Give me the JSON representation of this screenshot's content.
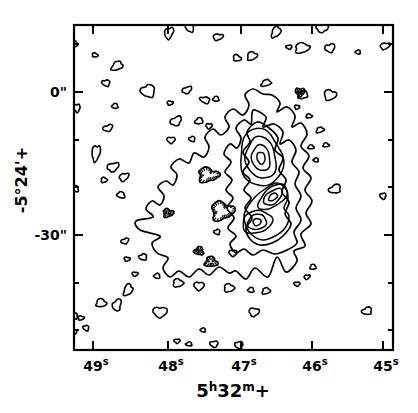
{
  "figure": {
    "background": "#ffffff",
    "line_color": "#000000",
    "kind": "radio continuum contour map"
  },
  "chart_data": {
    "type": "contour",
    "title": "",
    "xlabel": {
      "plain": "5h32m+",
      "parts": [
        {
          "text": "5"
        },
        {
          "text": "h",
          "sup": true
        },
        {
          "text": "32"
        },
        {
          "text": "m",
          "sup": true
        },
        {
          "text": "+"
        }
      ]
    },
    "ylabel": {
      "plain": "-5°24'+"
    },
    "x_ticks": [
      {
        "value": 49,
        "parts": [
          {
            "text": "49"
          },
          {
            "text": "s",
            "sup": true
          }
        ]
      },
      {
        "value": 48,
        "parts": [
          {
            "text": "48"
          },
          {
            "text": "s",
            "sup": true
          }
        ]
      },
      {
        "value": 47,
        "parts": [
          {
            "text": "47"
          },
          {
            "text": "s",
            "sup": true
          }
        ]
      },
      {
        "value": 46,
        "parts": [
          {
            "text": "46"
          },
          {
            "text": "s",
            "sup": true
          }
        ]
      },
      {
        "value": 45,
        "parts": [
          {
            "text": "45"
          },
          {
            "text": "s",
            "sup": true
          }
        ]
      }
    ],
    "y_ticks": [
      {
        "value": 0,
        "label": "0\""
      },
      {
        "value": -30,
        "label": "-30\""
      }
    ],
    "x_range_seconds": [
      49.3,
      44.8
    ],
    "y_range_arcsec": [
      14,
      -54
    ],
    "y_minor_tick_step_arcsec": 10,
    "levels_labeled": false,
    "visible_nested_levels": 6,
    "peaks": [
      {
        "ra_s": 46.67,
        "dec_arcsec": -13.8
      },
      {
        "ra_s": 46.52,
        "dec_arcsec": -22.0
      },
      {
        "ra_s": 46.74,
        "dec_arcsec": -27.3
      }
    ],
    "negative_features_ticked_contours": [
      {
        "ra_s": 46.14,
        "dec_arcsec": 0.0
      },
      {
        "ra_s": 47.41,
        "dec_arcsec": -17.4
      },
      {
        "ra_s": 47.22,
        "dec_arcsec": -24.9
      },
      {
        "ra_s": 47.54,
        "dec_arcsec": -33.3
      },
      {
        "ra_s": 47.37,
        "dec_arcsec": -35.6
      },
      {
        "ra_s": 47.97,
        "dec_arcsec": -25.4
      }
    ]
  },
  "render": {
    "size": {
      "w": 418,
      "h": 413
    },
    "plot": {
      "left": 74,
      "top": 25,
      "right": 393,
      "bottom": 350
    },
    "stroke": {
      "frame": 2.2,
      "tick": 2,
      "contour": 1.7,
      "blob": 1.6,
      "ring": 1.5
    },
    "ticks": {
      "x_major_px": [
        93,
        168,
        241,
        312,
        383
      ],
      "y_major_px": [
        92,
        235
      ],
      "y_minor_px": [
        44,
        140,
        187,
        283,
        330
      ],
      "major_len": 9,
      "minor_len": 5
    },
    "labels": {
      "x_tick_baseline": 371,
      "x_tick_size": 14,
      "sup_size": 10,
      "y_tick_x": 67,
      "y_tick_baselines": [
        97,
        240
      ],
      "y_tick_size": 14,
      "x_title": {
        "x": 233,
        "y": 397,
        "size": 18,
        "sup_size": 12
      },
      "y_title": {
        "x": 27,
        "y": 180,
        "size": 16
      }
    },
    "contours": {
      "outer": [
        [
          272,
          95
        ],
        [
          280,
          103
        ],
        [
          277,
          112
        ],
        [
          287,
          107
        ],
        [
          295,
          116
        ],
        [
          292,
          127
        ],
        [
          301,
          123
        ],
        [
          307,
          134
        ],
        [
          301,
          146
        ],
        [
          309,
          156
        ],
        [
          303,
          168
        ],
        [
          311,
          178
        ],
        [
          305,
          190
        ],
        [
          312,
          201
        ],
        [
          306,
          213
        ],
        [
          311,
          224
        ],
        [
          301,
          234
        ],
        [
          305,
          246
        ],
        [
          294,
          251
        ],
        [
          297,
          261
        ],
        [
          286,
          272
        ],
        [
          277,
          257
        ],
        [
          268,
          277
        ],
        [
          255,
          268
        ],
        [
          246,
          279
        ],
        [
          236,
          271
        ],
        [
          229,
          273
        ],
        [
          219,
          267
        ],
        [
          209,
          275
        ],
        [
          199,
          269
        ],
        [
          189,
          277
        ],
        [
          179,
          271
        ],
        [
          170,
          277
        ],
        [
          163,
          268
        ],
        [
          168,
          258
        ],
        [
          157,
          253
        ],
        [
          152,
          243
        ],
        [
          160,
          236
        ],
        [
          140,
          230
        ],
        [
          136,
          221
        ],
        [
          153,
          217
        ],
        [
          146,
          209
        ],
        [
          152,
          201
        ],
        [
          160,
          205
        ],
        [
          164,
          196
        ],
        [
          158,
          187
        ],
        [
          166,
          181
        ],
        [
          173,
          185
        ],
        [
          177,
          175
        ],
        [
          171,
          167
        ],
        [
          179,
          159
        ],
        [
          189,
          163
        ],
        [
          194,
          153
        ],
        [
          204,
          157
        ],
        [
          209,
          147
        ],
        [
          205,
          137
        ],
        [
          213,
          129
        ],
        [
          221,
          135
        ],
        [
          229,
          127
        ],
        [
          225,
          117
        ],
        [
          233,
          109
        ],
        [
          243,
          115
        ],
        [
          249,
          105
        ],
        [
          245,
          95
        ],
        [
          253,
          89
        ],
        [
          263,
          94
        ]
      ],
      "ridge": [
        [
          255,
          110
        ],
        [
          266,
          117
        ],
        [
          263,
          127
        ],
        [
          274,
          124
        ],
        [
          283,
          132
        ],
        [
          280,
          144
        ],
        [
          289,
          140
        ],
        [
          296,
          150
        ],
        [
          292,
          162
        ],
        [
          299,
          172
        ],
        [
          295,
          184
        ],
        [
          301,
          196
        ],
        [
          296,
          208
        ],
        [
          301,
          220
        ],
        [
          294,
          232
        ],
        [
          297,
          243
        ],
        [
          287,
          250
        ],
        [
          275,
          254
        ],
        [
          263,
          250
        ],
        [
          253,
          255
        ],
        [
          244,
          249
        ],
        [
          236,
          253
        ],
        [
          230,
          244
        ],
        [
          236,
          236
        ],
        [
          228,
          228
        ],
        [
          234,
          218
        ],
        [
          227,
          208
        ],
        [
          233,
          198
        ],
        [
          226,
          190
        ],
        [
          232,
          180
        ],
        [
          225,
          172
        ],
        [
          231,
          162
        ],
        [
          224,
          154
        ],
        [
          230,
          144
        ],
        [
          237,
          148
        ],
        [
          241,
          138
        ],
        [
          236,
          128
        ],
        [
          244,
          120
        ],
        [
          251,
          124
        ],
        [
          252,
          113
        ]
      ],
      "ridge_inner": [
        [
          257,
          122
        ],
        [
          269,
          128
        ],
        [
          278,
          138
        ],
        [
          275,
          150
        ],
        [
          283,
          158
        ],
        [
          279,
          170
        ],
        [
          286,
          180
        ],
        [
          282,
          192
        ],
        [
          289,
          202
        ],
        [
          285,
          214
        ],
        [
          291,
          224
        ],
        [
          283,
          236
        ],
        [
          272,
          243
        ],
        [
          260,
          245
        ],
        [
          250,
          239
        ],
        [
          246,
          228
        ],
        [
          252,
          218
        ],
        [
          245,
          208
        ],
        [
          251,
          198
        ],
        [
          244,
          190
        ],
        [
          250,
          180
        ],
        [
          243,
          172
        ],
        [
          249,
          162
        ],
        [
          243,
          152
        ],
        [
          250,
          142
        ],
        [
          247,
          132
        ]
      ],
      "lower_pair_ring": [
        [
          248,
          206
        ],
        [
          256,
          196
        ],
        [
          265,
          189
        ],
        [
          276,
          183
        ],
        [
          285,
          188
        ],
        [
          288,
          198
        ],
        [
          284,
          208
        ],
        [
          289,
          216
        ],
        [
          285,
          228
        ],
        [
          275,
          236
        ],
        [
          263,
          240
        ],
        [
          252,
          235
        ],
        [
          246,
          226
        ],
        [
          244,
          216
        ]
      ],
      "peak_rings": [
        {
          "cx": 261,
          "cy": 158,
          "rot": -10,
          "rings": [
            [
              21,
              29
            ],
            [
              15,
              21
            ],
            [
              9,
              13
            ],
            [
              4,
              6
            ]
          ]
        },
        {
          "cx": 273,
          "cy": 197,
          "rot": -38,
          "rings": [
            [
              17,
              9
            ],
            [
              11,
              6
            ],
            [
              5,
              3
            ]
          ]
        },
        {
          "cx": 257,
          "cy": 222,
          "rot": -15,
          "rings": [
            [
              15,
              11
            ],
            [
              9.5,
              7.5
            ],
            [
              4,
              3.5
            ]
          ]
        }
      ]
    },
    "hatched": [
      {
        "cx": 300,
        "cy": 92,
        "rx": 4.5,
        "ry": 4
      },
      {
        "cx": 208,
        "cy": 175,
        "rx": 10,
        "ry": 7
      },
      {
        "cx": 222,
        "cy": 211,
        "rx": 11,
        "ry": 9
      },
      {
        "cx": 199,
        "cy": 251,
        "rx": 4.5,
        "ry": 4
      },
      {
        "cx": 211,
        "cy": 262,
        "rx": 6,
        "ry": 5
      },
      {
        "cx": 168,
        "cy": 213,
        "rx": 5,
        "ry": 4
      }
    ],
    "blobs": [
      [
        95,
        55,
        3,
        2,
        20
      ],
      [
        117,
        66,
        6,
        4,
        -30
      ],
      [
        106,
        83,
        4,
        3,
        10
      ],
      [
        115,
        106,
        3,
        2.5,
        0
      ],
      [
        108,
        128,
        5,
        3,
        -20
      ],
      [
        96,
        153,
        4,
        8,
        10
      ],
      [
        113,
        167,
        6,
        4,
        -20
      ],
      [
        104,
        180,
        3,
        2.5,
        0
      ],
      [
        124,
        177,
        5,
        3.5,
        -30
      ],
      [
        121,
        195,
        4,
        3,
        20
      ],
      [
        148,
        91,
        7,
        6,
        0
      ],
      [
        170,
        103,
        3,
        2,
        0
      ],
      [
        187,
        90,
        5,
        3,
        -25
      ],
      [
        205,
        100,
        5,
        3,
        15
      ],
      [
        216,
        99,
        3,
        2.5,
        0
      ],
      [
        176,
        121,
        6,
        4,
        -30
      ],
      [
        171,
        140,
        4,
        3,
        0
      ],
      [
        192,
        139,
        3,
        2.5,
        0
      ],
      [
        169,
        33,
        4,
        6,
        25
      ],
      [
        190,
        27,
        4,
        5,
        0
      ],
      [
        218,
        37,
        5,
        3,
        -10
      ],
      [
        237,
        58,
        4,
        3,
        20
      ],
      [
        252,
        56,
        5,
        4,
        -20
      ],
      [
        266,
        83,
        5,
        3,
        -20
      ],
      [
        276,
        32,
        4,
        6,
        30
      ],
      [
        289,
        47,
        3,
        2,
        0
      ],
      [
        302,
        48,
        7,
        5,
        -10
      ],
      [
        322,
        28,
        6,
        4,
        0
      ],
      [
        330,
        48,
        5,
        4,
        -20
      ],
      [
        358,
        52,
        2.5,
        2,
        0
      ],
      [
        385,
        46,
        5,
        3,
        -15
      ],
      [
        330,
        95,
        6,
        5,
        0
      ],
      [
        303,
        95,
        5,
        3.5,
        -30
      ],
      [
        297,
        107,
        2.5,
        2,
        0
      ],
      [
        309,
        116,
        3,
        2,
        0
      ],
      [
        320,
        130,
        4,
        2.5,
        -20
      ],
      [
        326,
        145,
        3,
        2,
        0
      ],
      [
        335,
        189,
        6,
        4,
        -20
      ],
      [
        383,
        196,
        3,
        3,
        0
      ],
      [
        311,
        147,
        3,
        2,
        0
      ],
      [
        316,
        160,
        2.5,
        2,
        0
      ],
      [
        199,
        121,
        4,
        3,
        -20
      ],
      [
        209,
        126,
        3,
        2.5,
        0
      ],
      [
        217,
        232,
        3,
        2.5,
        0
      ],
      [
        233,
        253,
        4,
        3,
        0
      ],
      [
        125,
        241,
        4,
        2.5,
        -20
      ],
      [
        143,
        257,
        4,
        3,
        0
      ],
      [
        127,
        259,
        3,
        2,
        0
      ],
      [
        157,
        276,
        3,
        2.5,
        0
      ],
      [
        178,
        283,
        5,
        4,
        0
      ],
      [
        199,
        286,
        5,
        4,
        0
      ],
      [
        135,
        274,
        3,
        2,
        0
      ],
      [
        128,
        290,
        4,
        6,
        25
      ],
      [
        101,
        303,
        5,
        4,
        0
      ],
      [
        117,
        305,
        4,
        6,
        20
      ],
      [
        81,
        318,
        3,
        2,
        0
      ],
      [
        86,
        328,
        3,
        2.5,
        30
      ],
      [
        160,
        312,
        7,
        5,
        0
      ],
      [
        177,
        341,
        3,
        2,
        0
      ],
      [
        189,
        344,
        3,
        2,
        0
      ],
      [
        203,
        330,
        2.5,
        2,
        0
      ],
      [
        214,
        344,
        4,
        3,
        0
      ],
      [
        239,
        345,
        4,
        3.5,
        0
      ],
      [
        229,
        288,
        5,
        4,
        0
      ],
      [
        251,
        290,
        3,
        2.5,
        0
      ],
      [
        266,
        291,
        4,
        3,
        -20
      ],
      [
        254,
        312,
        5,
        4,
        0
      ],
      [
        297,
        284,
        3,
        2,
        0
      ],
      [
        313,
        267,
        3,
        2.5,
        0
      ],
      [
        307,
        277,
        3,
        2,
        -20
      ],
      [
        367,
        311,
        5,
        3.5,
        -15
      ],
      [
        75,
        44,
        2.5,
        3,
        0
      ],
      [
        77,
        108,
        3,
        4,
        0
      ],
      [
        76,
        189,
        2.5,
        3,
        0
      ],
      [
        75,
        316,
        2.5,
        3,
        0
      ],
      [
        74,
        332,
        2.5,
        3,
        0
      ]
    ]
  }
}
